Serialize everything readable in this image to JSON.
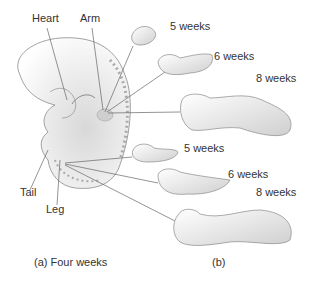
{
  "figure": {
    "embryo_labels": {
      "heart": "Heart",
      "arm": "Arm",
      "tail": "Tail",
      "leg": "Leg"
    },
    "arm_stages": [
      "5 weeks",
      "6 weeks",
      "8 weeks"
    ],
    "leg_stages": [
      "5 weeks",
      "6 weeks",
      "8 weeks"
    ],
    "captions": {
      "a": "(a)  Four weeks",
      "b": "(b)"
    }
  }
}
